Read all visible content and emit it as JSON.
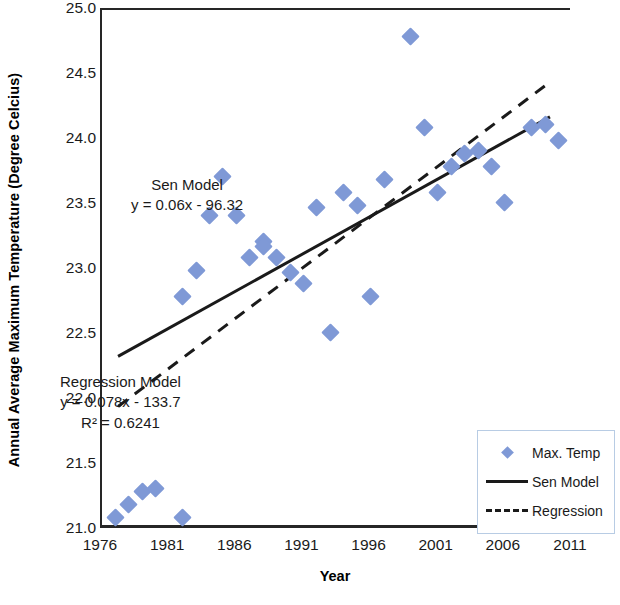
{
  "chart_data": {
    "type": "scatter",
    "title": "",
    "xlabel": "Year",
    "ylabel": "Annual Average Maximum Temperature (Degree Celcius)",
    "xlim": [
      1976,
      2011
    ],
    "ylim": [
      21.0,
      25.0
    ],
    "xticks": [
      1976,
      1981,
      1986,
      1991,
      1996,
      2001,
      2006,
      2011
    ],
    "yticks": [
      "21.0",
      "21.5",
      "22.0",
      "22.5",
      "23.0",
      "23.5",
      "24.0",
      "24.5",
      "25.0"
    ],
    "grid": false,
    "legend_position": "bottom-right",
    "marker_color": "#7f99d6",
    "line_color": "#1a1a1a",
    "series": [
      {
        "name": "Max. Temp",
        "type": "scatter",
        "points": [
          {
            "x": 1977,
            "y": 21.1
          },
          {
            "x": 1978,
            "y": 21.2
          },
          {
            "x": 1979,
            "y": 21.3
          },
          {
            "x": 1980,
            "y": 21.32
          },
          {
            "x": 1982,
            "y": 21.1
          },
          {
            "x": 1982,
            "y": 22.8
          },
          {
            "x": 1983,
            "y": 23.0
          },
          {
            "x": 1984,
            "y": 23.42
          },
          {
            "x": 1985,
            "y": 23.72
          },
          {
            "x": 1986,
            "y": 23.42
          },
          {
            "x": 1987,
            "y": 23.1
          },
          {
            "x": 1988,
            "y": 23.22
          },
          {
            "x": 1988,
            "y": 23.18
          },
          {
            "x": 1989,
            "y": 23.1
          },
          {
            "x": 1990,
            "y": 22.98
          },
          {
            "x": 1991,
            "y": 22.9
          },
          {
            "x": 1992,
            "y": 23.48
          },
          {
            "x": 1993,
            "y": 22.52
          },
          {
            "x": 1994,
            "y": 23.6
          },
          {
            "x": 1995,
            "y": 23.5
          },
          {
            "x": 1996,
            "y": 22.8
          },
          {
            "x": 1997,
            "y": 23.7
          },
          {
            "x": 1999,
            "y": 24.8
          },
          {
            "x": 2000,
            "y": 24.1
          },
          {
            "x": 2001,
            "y": 23.6
          },
          {
            "x": 2002,
            "y": 23.8
          },
          {
            "x": 2003,
            "y": 23.9
          },
          {
            "x": 2004,
            "y": 23.92
          },
          {
            "x": 2005,
            "y": 23.8
          },
          {
            "x": 2006,
            "y": 23.52
          },
          {
            "x": 2008,
            "y": 24.1
          },
          {
            "x": 2009,
            "y": 24.12
          },
          {
            "x": 2010,
            "y": 24.0
          }
        ]
      },
      {
        "name": "Sen Model",
        "type": "line",
        "style": "solid",
        "equation": "y = 0.06x - 96.32",
        "slope": 0.06,
        "intercept": -96.32,
        "endpoints": [
          {
            "x": 1977.2,
            "y": 22.31
          },
          {
            "x": 2009.5,
            "y": 24.17
          }
        ]
      },
      {
        "name": "Regression",
        "type": "line",
        "style": "dashed",
        "equation": "y = 0.078x - 133.7",
        "r_squared": "0.6241",
        "slope": 0.078,
        "intercept": -133.7,
        "endpoints": [
          {
            "x": 1977.2,
            "y": 21.92
          },
          {
            "x": 2009.5,
            "y": 24.44
          }
        ]
      }
    ],
    "annotations": [
      {
        "id": "sen",
        "lines": [
          "Sen Model",
          "y = 0.06x - 96.32"
        ]
      },
      {
        "id": "regression",
        "lines": [
          "Regression Model",
          "y = 0.078x - 133.7",
          "R² = 0.6241"
        ]
      }
    ],
    "legend": [
      {
        "label": "Max. Temp",
        "key": "diamond-marker"
      },
      {
        "label": "Sen Model",
        "key": "solid-line"
      },
      {
        "label": "Regression",
        "key": "dashed-line"
      }
    ]
  }
}
